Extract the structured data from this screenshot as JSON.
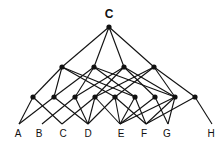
{
  "diagram": {
    "type": "lattice",
    "root": {
      "id": "root",
      "label": "C"
    },
    "levels": [
      [
        "root"
      ],
      [
        "m1",
        "m2",
        "m3",
        "m4"
      ],
      [
        "n1",
        "n2",
        "n3",
        "n4",
        "n5",
        "n6",
        "n7",
        "n8",
        "n9"
      ],
      [
        "A",
        "B",
        "C",
        "D",
        "E",
        "F",
        "G",
        "H"
      ]
    ],
    "leaves": [
      {
        "id": "A",
        "label": "A"
      },
      {
        "id": "B",
        "label": "B"
      },
      {
        "id": "C",
        "label": "C"
      },
      {
        "id": "D",
        "label": "D"
      },
      {
        "id": "E",
        "label": "E"
      },
      {
        "id": "F",
        "label": "F"
      },
      {
        "id": "G",
        "label": "G"
      },
      {
        "id": "H",
        "label": "H"
      }
    ],
    "edges": [
      [
        "root",
        "m1"
      ],
      [
        "root",
        "m2"
      ],
      [
        "root",
        "m3"
      ],
      [
        "root",
        "m4"
      ],
      [
        "m1",
        "n1"
      ],
      [
        "m1",
        "n2"
      ],
      [
        "m1",
        "n5"
      ],
      [
        "m1",
        "n6"
      ],
      [
        "m2",
        "n2"
      ],
      [
        "m2",
        "n3"
      ],
      [
        "m2",
        "n6"
      ],
      [
        "m2",
        "n8"
      ],
      [
        "m3",
        "n3"
      ],
      [
        "m3",
        "n4"
      ],
      [
        "m3",
        "n7"
      ],
      [
        "m3",
        "n8"
      ],
      [
        "m4",
        "n4"
      ],
      [
        "m4",
        "n5"
      ],
      [
        "m4",
        "n8"
      ],
      [
        "m4",
        "n9"
      ],
      [
        "n1",
        "A"
      ],
      [
        "n1",
        "C"
      ],
      [
        "n2",
        "A"
      ],
      [
        "n2",
        "D"
      ],
      [
        "n3",
        "B"
      ],
      [
        "n3",
        "D"
      ],
      [
        "n4",
        "C"
      ],
      [
        "n4",
        "D"
      ],
      [
        "n4",
        "E"
      ],
      [
        "n5",
        "D"
      ],
      [
        "n5",
        "E"
      ],
      [
        "n5",
        "F"
      ],
      [
        "n6",
        "E"
      ],
      [
        "n6",
        "F"
      ],
      [
        "n7",
        "E"
      ],
      [
        "n7",
        "G"
      ],
      [
        "n8",
        "E"
      ],
      [
        "n8",
        "F"
      ],
      [
        "n8",
        "G"
      ],
      [
        "n9",
        "F"
      ],
      [
        "n9",
        "H"
      ]
    ]
  }
}
